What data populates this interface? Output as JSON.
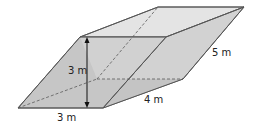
{
  "figure": {
    "type": "parallelepiped",
    "labels": {
      "height": "3 m",
      "base_width": "3 m",
      "depth": "4 m",
      "slant_edge": "5 m"
    },
    "colors": {
      "front_face": "#b9b9b9",
      "right_face": "#d0d0d0",
      "top_face": "#e2e2e2",
      "edge": "#555555",
      "hidden_edge": "#555555",
      "arrow": "#111111"
    }
  }
}
